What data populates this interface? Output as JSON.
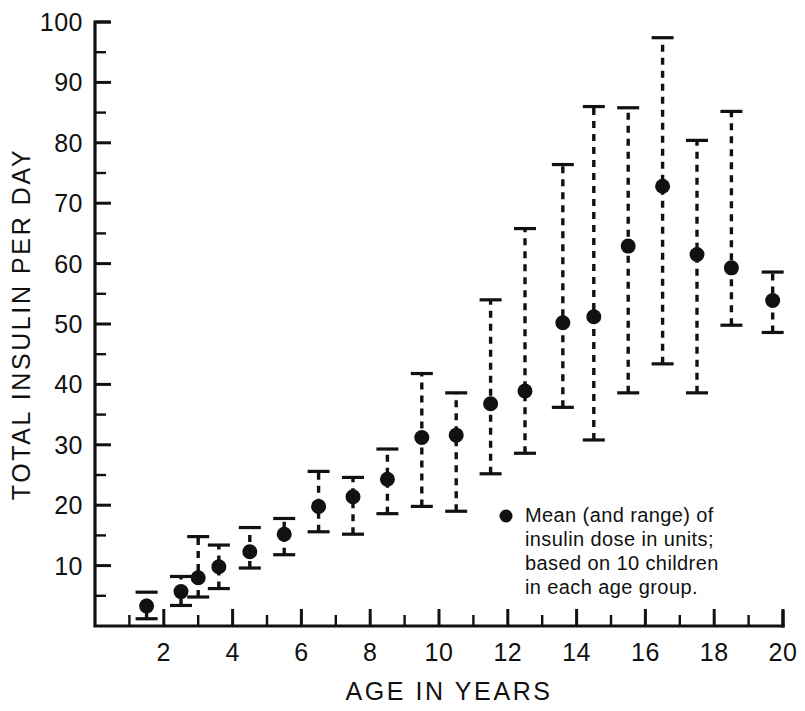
{
  "figure": {
    "background_color": "#ffffff",
    "ink_color": "#111111"
  },
  "chart_data": {
    "type": "scatter",
    "title": "",
    "xlabel": "AGE IN YEARS",
    "ylabel": "TOTAL INSULIN PER DAY",
    "xlim": [
      0,
      20
    ],
    "ylim": [
      0,
      100
    ],
    "grid": false,
    "legend_position": "inside-lower-right",
    "x_major_ticks": [
      2,
      4,
      6,
      8,
      10,
      12,
      14,
      16,
      18,
      20
    ],
    "x_major_tick_labels": [
      "2",
      "4",
      "6",
      "8",
      "10",
      "12",
      "14",
      "16",
      "18",
      "20"
    ],
    "x_minor_ticks": [
      1,
      3,
      5,
      7,
      9,
      11,
      13,
      15,
      17,
      19
    ],
    "y_major_ticks": [
      10,
      20,
      30,
      40,
      50,
      60,
      70,
      80,
      90,
      100
    ],
    "y_major_tick_labels": [
      "10",
      "20",
      "30",
      "40",
      "50",
      "60",
      "70",
      "80",
      "90",
      "100"
    ],
    "y_minor_ticks": [
      5,
      15,
      25,
      35,
      45,
      55,
      65,
      75,
      85,
      95
    ],
    "marker": "filled-circle",
    "errorbar_style": "dashed-with-caps",
    "series": [
      {
        "name": "Mean insulin dose (with range)",
        "points": [
          {
            "x": 1.5,
            "mean": 3.3,
            "low": 1.2,
            "high": 5.6
          },
          {
            "x": 2.5,
            "mean": 5.7,
            "low": 3.4,
            "high": 8.2
          },
          {
            "x": 3.0,
            "mean": 8.0,
            "low": 4.8,
            "high": 14.8
          },
          {
            "x": 3.6,
            "mean": 9.8,
            "low": 6.2,
            "high": 13.4
          },
          {
            "x": 4.5,
            "mean": 12.3,
            "low": 9.6,
            "high": 16.3
          },
          {
            "x": 5.5,
            "mean": 15.2,
            "low": 11.8,
            "high": 17.8
          },
          {
            "x": 6.5,
            "mean": 19.8,
            "low": 15.6,
            "high": 25.6
          },
          {
            "x": 7.5,
            "mean": 21.4,
            "low": 15.2,
            "high": 24.6
          },
          {
            "x": 8.5,
            "mean": 24.3,
            "low": 18.6,
            "high": 29.3
          },
          {
            "x": 9.5,
            "mean": 31.2,
            "low": 19.8,
            "high": 41.8
          },
          {
            "x": 10.5,
            "mean": 31.6,
            "low": 19.0,
            "high": 38.6
          },
          {
            "x": 11.5,
            "mean": 36.8,
            "low": 25.2,
            "high": 54.0
          },
          {
            "x": 12.5,
            "mean": 38.9,
            "low": 28.6,
            "high": 65.8
          },
          {
            "x": 13.6,
            "mean": 50.2,
            "low": 36.2,
            "high": 76.4
          },
          {
            "x": 14.5,
            "mean": 51.2,
            "low": 30.8,
            "high": 86.0
          },
          {
            "x": 15.5,
            "mean": 62.9,
            "low": 38.6,
            "high": 85.8
          },
          {
            "x": 16.5,
            "mean": 72.8,
            "low": 43.4,
            "high": 97.4
          },
          {
            "x": 17.5,
            "mean": 61.5,
            "low": 38.6,
            "high": 80.4
          },
          {
            "x": 18.5,
            "mean": 59.3,
            "low": 49.8,
            "high": 85.2
          },
          {
            "x": 19.7,
            "mean": 53.9,
            "low": 48.6,
            "high": 58.6
          }
        ]
      }
    ],
    "annotations": [
      {
        "name": "legend-note",
        "marker": "filled-circle",
        "lines": [
          "Mean  (and range) of",
          "insulin dose in units;",
          "based on 10 children",
          "in each age group."
        ]
      }
    ]
  }
}
